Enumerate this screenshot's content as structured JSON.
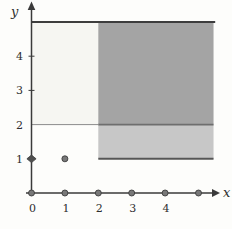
{
  "figure": {
    "background": "#fdfdfb",
    "axis_color": "#3a3a3a",
    "text_color": "#2e2e2e",
    "point_fill": "#787878",
    "point_stroke": "#3c3c3c",
    "diamond_fill": "#4f4f4f"
  },
  "chart_data": {
    "type": "region",
    "title": "",
    "xlabel": "x",
    "ylabel": "y",
    "x_ticks": [
      0,
      1,
      2,
      3,
      4
    ],
    "y_ticks": [
      1,
      2,
      3,
      4
    ],
    "y_axis_small_ticks": [
      3,
      4
    ],
    "xlim": [
      0,
      5.5
    ],
    "ylim": [
      0,
      5.6
    ],
    "grid": false,
    "legend": false,
    "regions": [
      {
        "name": "upper-left-light",
        "x1": 0,
        "y1": 2,
        "x2": 2,
        "y2": 5,
        "color": "#f6f6f2"
      },
      {
        "name": "upper-right-dark",
        "x1": 2,
        "y1": 2,
        "x2": 5.45,
        "y2": 5,
        "color": "#a4a4a4"
      },
      {
        "name": "lower-right-medium",
        "x1": 2,
        "y1": 1,
        "x2": 5.45,
        "y2": 2,
        "color": "#c7c7c7"
      }
    ],
    "boundary_lines": [
      {
        "name": "y5-top",
        "x1": 0,
        "y1": 5,
        "x2": 5.5,
        "y2": 5,
        "width": 2,
        "color": "#3d3d3d"
      },
      {
        "name": "y2-left-thin",
        "x1": 0,
        "y1": 2,
        "x2": 2,
        "y2": 2,
        "width": 1,
        "color": "#8a8a8a"
      },
      {
        "name": "y2-right",
        "x1": 2,
        "y1": 2,
        "x2": 5.45,
        "y2": 2,
        "width": 1.8,
        "color": "#6e6e6e"
      },
      {
        "name": "y1-bottom",
        "x1": 2,
        "y1": 1,
        "x2": 5.45,
        "y2": 1,
        "width": 2,
        "color": "#565656"
      }
    ],
    "points": [
      {
        "x": 0,
        "y": 0,
        "marker": "circle"
      },
      {
        "x": 1,
        "y": 0,
        "marker": "circle"
      },
      {
        "x": 2,
        "y": 0,
        "marker": "circle"
      },
      {
        "x": 3,
        "y": 0,
        "marker": "circle"
      },
      {
        "x": 4,
        "y": 0,
        "marker": "circle"
      },
      {
        "x": 5,
        "y": 0,
        "marker": "circle"
      },
      {
        "x": 0,
        "y": 1,
        "marker": "diamond"
      },
      {
        "x": 1,
        "y": 1,
        "marker": "circle"
      }
    ]
  }
}
